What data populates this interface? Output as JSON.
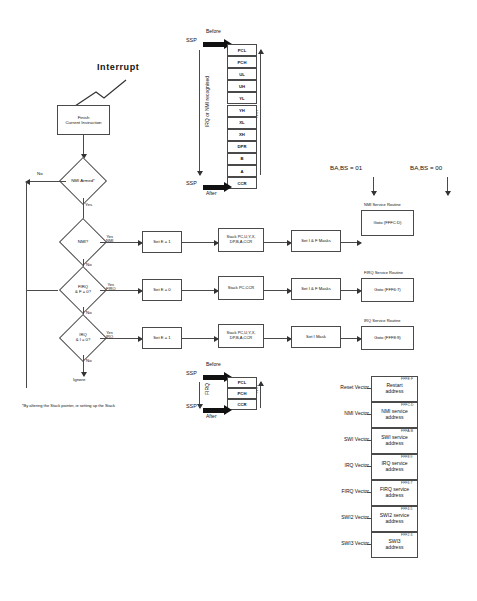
{
  "diagram": {
    "title_label": "Interrupt",
    "footnote": "*By altering the Stack pointer, ie setting up the Stack",
    "bus_states": [
      {
        "label": "BA,BS  =  01"
      },
      {
        "label": "BA,BS  =  00"
      }
    ],
    "flow": {
      "finish_box": "Finish\nCurrent Instruction",
      "nmi_armed": "NMI Armed*",
      "nmi_test": "NMI?",
      "firq_test": "FIRQ\n& F = 0?",
      "irq_test": "IRQ\n& I = 0?",
      "ignore": "Ignore",
      "yes": "Yes",
      "no": "No",
      "yes_nmi": "Yes\nNMI",
      "yes_firq": "Yes\nFIRQ",
      "yes_irq": "Yes\nIRQ"
    },
    "set_e_boxes": [
      {
        "label": "Set E = 1"
      },
      {
        "label": "Set E = 0"
      },
      {
        "label": "Set E = 1"
      }
    ],
    "stack_boxes": [
      {
        "label": "Stack PC,U,Y,X,\nDP,B,A,CCR"
      },
      {
        "label": "Stack PC,CCR"
      },
      {
        "label": "Stack PC,U,Y,X,\nDP,B,A,CCR"
      }
    ],
    "mask_boxes": [
      {
        "label": "Set I & F Masks"
      },
      {
        "label": "Set I & F Masks"
      },
      {
        "label": "Set I Mask"
      }
    ],
    "service_routines": [
      {
        "title": "NMI Service Routine",
        "goto": "Goto  (FFFC:D)"
      },
      {
        "title": "FIRQ Service Routine",
        "goto": "Goto  (FFF6:7)"
      },
      {
        "title": "IRQ Service Routine",
        "goto": "Goto  (FFF8:9)"
      }
    ],
    "irq_nmi_stack": {
      "before_label": "Before",
      "after_label": "After",
      "ssp_label": "SSP",
      "side_label": "IRQ  or  NMI  recognised",
      "rti_label": "RTI",
      "cells": [
        "PCL",
        "PCH",
        "UL",
        "UH",
        "YL",
        "YH",
        "XL",
        "XH",
        "DPR",
        "B",
        "A",
        "CCR"
      ]
    },
    "firq_stack": {
      "before_label": "Before",
      "after_label": "After",
      "ssp_label": "SSP",
      "side_label": "FIRQ",
      "rti_label": "RTI",
      "cells": [
        "PCL",
        "PCH",
        "CCR"
      ]
    },
    "vector_table": [
      {
        "name": "Reset Vector",
        "addr": "FFFE:F",
        "content": "Restart\naddress"
      },
      {
        "name": "NMI Vector",
        "addr": "FFFC:D",
        "content": "NMI service\naddress"
      },
      {
        "name": "SWI Vector",
        "addr": "FFFA:B",
        "content": "SWI service\naddress"
      },
      {
        "name": "IRQ Vector",
        "addr": "FFF8:9",
        "content": "IRQ service\naddress"
      },
      {
        "name": "FIRQ Vector",
        "addr": "FFF6:7",
        "content": "FIRQ service\naddress"
      },
      {
        "name": "SWI2 Vector",
        "addr": "FFF4:5",
        "content": "SWI2 service\naddress"
      },
      {
        "name": "SWI3 Vector",
        "addr": "FFF2:3",
        "content": "SWI3\naddress"
      }
    ]
  }
}
